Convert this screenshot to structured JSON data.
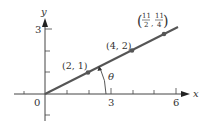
{
  "diagram": {
    "type": "coordinate-plane",
    "axes": {
      "x_label": "x",
      "y_label": "y",
      "origin_label": "0",
      "x_ticks": [
        1,
        2,
        3,
        4,
        5,
        6
      ],
      "x_tick_labels": {
        "3": "3",
        "6": "6"
      },
      "y_ticks": [
        -1,
        1,
        2,
        3
      ],
      "y_tick_labels": {
        "3": "3"
      }
    },
    "line": {
      "equation": "y = x/2",
      "color": "#555555"
    },
    "points": [
      {
        "x": 2,
        "y": 1,
        "label": "(2, 1)"
      },
      {
        "x": 4,
        "y": 2,
        "label": "(4, 2)"
      },
      {
        "x": 5.5,
        "y": 2.75,
        "label_num_x": "11",
        "label_den_x": "2",
        "label_num_y": "11",
        "label_den_y": "4"
      }
    ],
    "angle": {
      "label": "θ"
    },
    "colors": {
      "axis": "#444444",
      "line": "#555555",
      "point": "#555555",
      "text": "#333333"
    }
  }
}
